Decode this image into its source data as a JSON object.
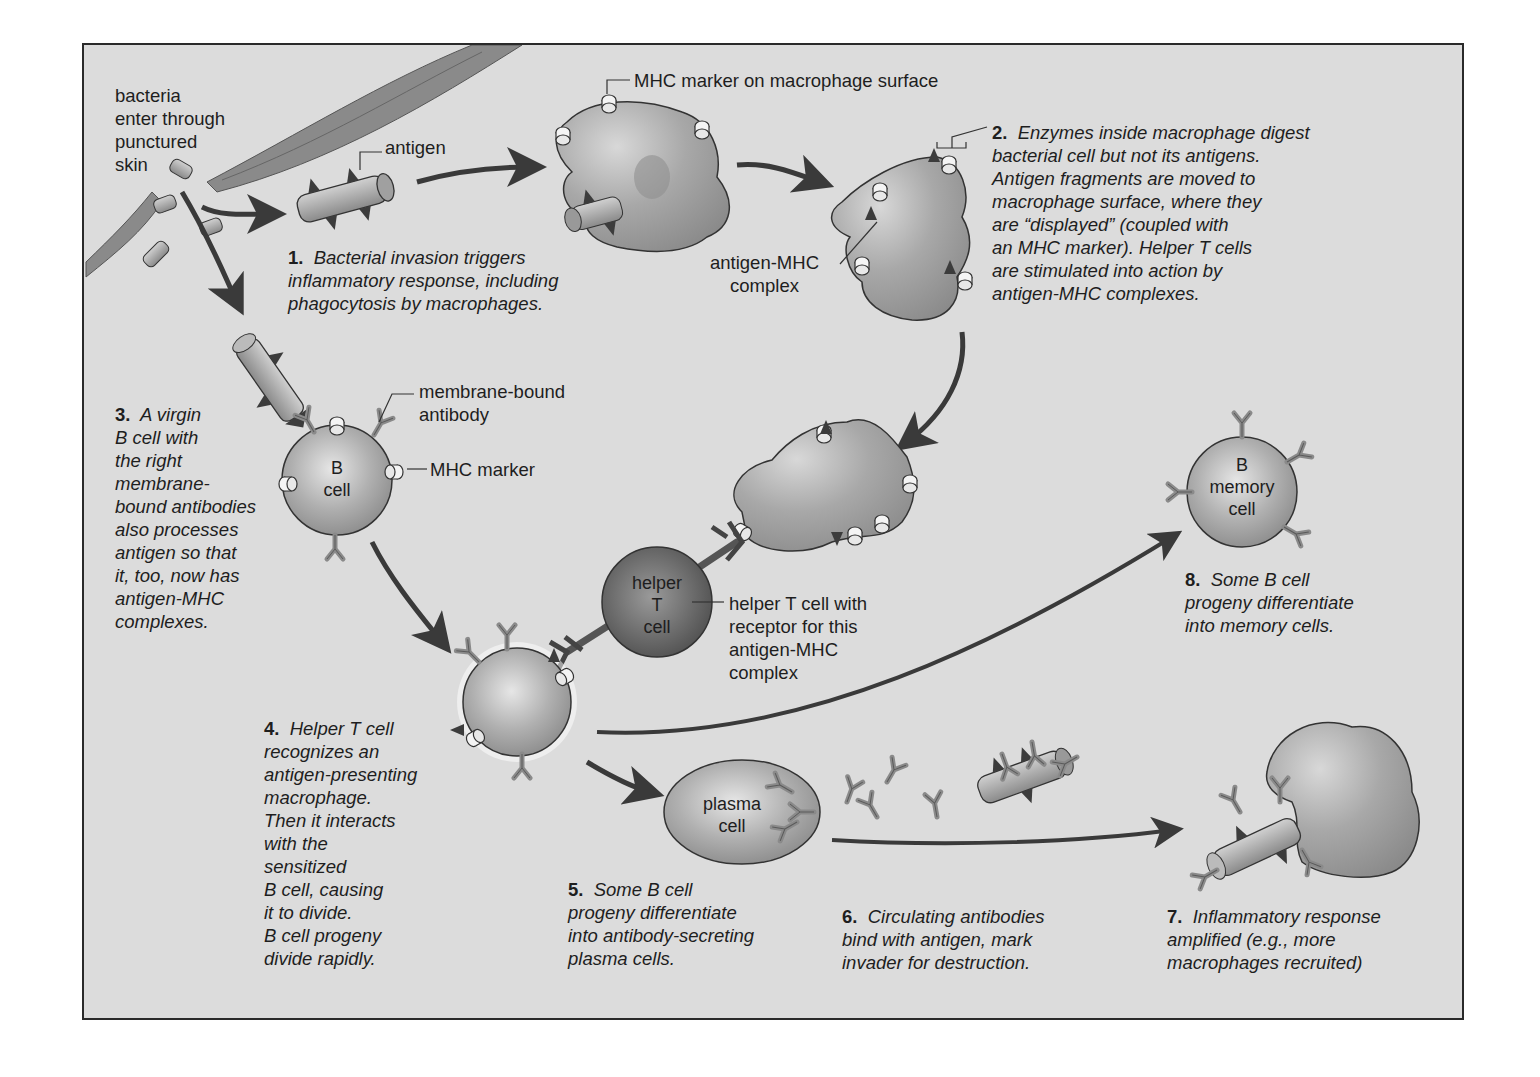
{
  "diagram": {
    "colors": {
      "background": "#dcdcdc",
      "frame_border": "#2a2a2a",
      "cell_fill": "#a8a8a8",
      "helper_t_fill": "#6e6e6e",
      "arrow": "#3a3a3a",
      "text": "#1e1e1e"
    },
    "labels": {
      "bacteria_entry": "bacteria\nenter through\npunctured\nskin",
      "antigen": "antigen",
      "mhc_macrophage": "MHC marker on macrophage surface",
      "antigen_mhc_complex": "antigen-MHC\ncomplex",
      "membrane_bound_antibody": "membrane-bound\nantibody",
      "mhc_marker": "MHC marker",
      "helper_t_receptor": "helper T cell with\nreceptor for this\nantigen-MHC\ncomplex"
    },
    "cells": {
      "b_cell": "B\ncell",
      "helper_t": "helper\nT\ncell",
      "b_memory": "B\nmemory\ncell",
      "plasma": "plasma\ncell"
    },
    "steps": [
      {
        "num": "1.",
        "text": "Bacterial invasion triggers\ninflammatory response, including\nphagocytosis by macrophages."
      },
      {
        "num": "2.",
        "text": "Enzymes inside macrophage digest\nbacterial cell but not its antigens.\nAntigen fragments are moved to\nmacrophage surface, where they\nare “displayed” (coupled with\nan MHC marker). Helper T cells\nare stimulated into action by\nantigen-MHC complexes."
      },
      {
        "num": "3.",
        "text": "A virgin\nB cell with\nthe right\nmembrane-\nbound antibodies\nalso processes\nantigen so that\nit, too, now has\nantigen-MHC\ncomplexes."
      },
      {
        "num": "4.",
        "text": "Helper T cell\nrecognizes an\nantigen-presenting\nmacrophage.\nThen it interacts\nwith the\nsensitized\nB cell, causing\nit to divide.\nB cell progeny\ndivide rapidly."
      },
      {
        "num": "5.",
        "text": "Some B cell\nprogeny differentiate\ninto antibody-secreting\nplasma cells."
      },
      {
        "num": "6.",
        "text": "Circulating antibodies\nbind with antigen, mark\ninvader for destruction."
      },
      {
        "num": "7.",
        "text": "Inflammatory response\namplified (e.g., more\nmacrophages recruited)"
      },
      {
        "num": "8.",
        "text": "Some B cell\nprogeny differentiate\ninto memory cells."
      }
    ]
  }
}
